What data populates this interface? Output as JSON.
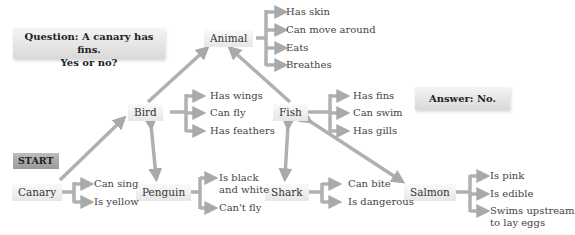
{
  "question": {
    "line1": "Question: A canary has fins.",
    "line2": "Yes or no?"
  },
  "answer": "Answer: No.",
  "start_label": "START",
  "nodes": {
    "animal": {
      "label": "Animal",
      "properties": [
        "Has skin",
        "Can move around",
        "Eats",
        "Breathes"
      ]
    },
    "bird": {
      "label": "Bird",
      "properties": [
        "Has wings",
        "Can fly",
        "Has feathers"
      ]
    },
    "fish": {
      "label": "Fish",
      "properties": [
        "Has fins",
        "Can swim",
        "Has gills"
      ]
    },
    "canary": {
      "label": "Canary",
      "properties": [
        "Can sing",
        "Is yellow"
      ]
    },
    "penguin": {
      "label": "Penguin",
      "properties": [
        "Is black and white",
        "Can't fly"
      ],
      "prop_lines": [
        "Is black",
        "and white"
      ]
    },
    "shark": {
      "label": "Shark",
      "properties": [
        "Can bite",
        "Is dangerous"
      ]
    },
    "salmon": {
      "label": "Salmon",
      "properties": [
        "Is pink",
        "Is edible",
        "Swims upstream to lay eggs"
      ],
      "prop_lines": [
        "Swims upstream",
        "to lay eggs"
      ]
    }
  },
  "colors": {
    "arrow": "#aaaaaa",
    "node_bg": "#ececec",
    "start_bg": "#a8a8a8"
  }
}
